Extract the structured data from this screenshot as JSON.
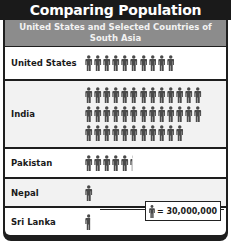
{
  "title": "Comparing Population",
  "subtitle": "United States and Selected Countries of South Asia",
  "legend": {
    "icon": "person-icon",
    "text": "= 30,000,000"
  },
  "colors": {
    "title_bg": "#1a1a1a",
    "subtitle_bg": "#8c8c8c",
    "icon": "#4a4a4a",
    "row_alt": "#f2f2f2"
  },
  "rows": [
    {
      "label": "United States",
      "icons_per_line": [
        10
      ],
      "partial": 0
    },
    {
      "label": "India",
      "icons_per_line": [
        13,
        13,
        11
      ],
      "partial": 0
    },
    {
      "label": "Pakistan",
      "icons_per_line": [
        5
      ],
      "partial": 0.3
    },
    {
      "label": "Nepal",
      "icons_per_line": [
        1
      ],
      "partial": 0
    },
    {
      "label": "Sri Lanka",
      "icons_per_line": [
        0
      ],
      "partial": 0.7
    }
  ],
  "chart_data": {
    "type": "pictograph",
    "title": "Comparing Population",
    "subtitle": "United States and Selected Countries of South Asia",
    "unit": "1 icon = 30,000,000 people",
    "categories": [
      "United States",
      "India",
      "Pakistan",
      "Nepal",
      "Sri Lanka"
    ],
    "icon_counts": [
      10,
      37,
      5.3,
      1,
      0.7
    ],
    "values": [
      300000000,
      1110000000,
      159000000,
      30000000,
      21000000
    ],
    "legend_position": "bottom-right"
  }
}
